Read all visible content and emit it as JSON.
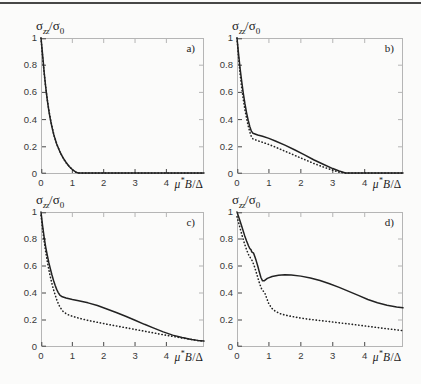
{
  "page": {
    "bg": "#fbfbfa",
    "rule_color": "#474747",
    "frame_color": "#b5b5b5",
    "tick_color": "#474747",
    "curve_color": "#222222"
  },
  "axis_labels": {
    "y_sigma": "σ",
    "y_sub": "zz",
    "y_slash": "/",
    "y_sigma0": "σ",
    "y_sub0": "0",
    "x_mu": "μ",
    "x_star": "*",
    "x_B": "B",
    "x_slash": "/",
    "x_delta": "Δ"
  },
  "chart_data": [
    {
      "type": "line",
      "label": "a)",
      "xlim": [
        0,
        5.2
      ],
      "ylim": [
        0,
        1
      ],
      "xticks": [
        0,
        1,
        2,
        3,
        4
      ],
      "xtick_labels": [
        "0",
        "1",
        "2",
        "3",
        "4"
      ],
      "yticks": [
        0,
        0.2,
        0.4,
        0.6,
        0.8,
        1
      ],
      "ytick_labels": [
        "0",
        "0.2",
        "0.4",
        "0.6",
        "0.8",
        "1"
      ],
      "series": [
        {
          "name": "solid",
          "style": "solid",
          "points": [
            [
              0,
              1
            ],
            [
              0.03,
              0.93
            ],
            [
              0.07,
              0.83
            ],
            [
              0.1,
              0.75
            ],
            [
              0.15,
              0.64
            ],
            [
              0.2,
              0.545
            ],
            [
              0.25,
              0.465
            ],
            [
              0.3,
              0.4
            ],
            [
              0.35,
              0.345
            ],
            [
              0.4,
              0.295
            ],
            [
              0.5,
              0.22
            ],
            [
              0.6,
              0.165
            ],
            [
              0.7,
              0.12
            ],
            [
              0.8,
              0.085
            ],
            [
              0.9,
              0.055
            ],
            [
              1,
              0.033
            ],
            [
              1.1,
              0.015
            ],
            [
              1.2,
              0.005
            ],
            [
              1.35,
              0.001
            ],
            [
              1.6,
              0
            ],
            [
              5.2,
              0
            ]
          ]
        },
        {
          "name": "dotted",
          "style": "dotted",
          "points": [
            [
              0,
              1
            ],
            [
              0.04,
              0.89
            ],
            [
              0.08,
              0.79
            ],
            [
              0.12,
              0.7
            ],
            [
              0.17,
              0.6
            ],
            [
              0.22,
              0.515
            ],
            [
              0.28,
              0.43
            ],
            [
              0.34,
              0.36
            ],
            [
              0.42,
              0.28
            ],
            [
              0.52,
              0.21
            ],
            [
              0.62,
              0.155
            ],
            [
              0.72,
              0.11
            ],
            [
              0.82,
              0.078
            ],
            [
              0.92,
              0.05
            ],
            [
              1.02,
              0.028
            ],
            [
              1.12,
              0.012
            ],
            [
              1.25,
              0.003
            ],
            [
              1.5,
              0
            ],
            [
              5.2,
              0
            ]
          ]
        }
      ]
    },
    {
      "type": "line",
      "label": "b)",
      "xlim": [
        0,
        5.2
      ],
      "ylim": [
        0,
        1
      ],
      "xticks": [
        0,
        1,
        2,
        3,
        4
      ],
      "xtick_labels": [
        "0",
        "1",
        "2",
        "3",
        "4"
      ],
      "yticks": [
        0,
        0.2,
        0.4,
        0.6,
        0.8,
        1
      ],
      "ytick_labels": [
        "0",
        "0.2",
        "0.4",
        "0.6",
        "0.8",
        "1"
      ],
      "series": [
        {
          "name": "solid",
          "style": "solid",
          "points": [
            [
              0,
              1
            ],
            [
              0.05,
              0.88
            ],
            [
              0.1,
              0.77
            ],
            [
              0.15,
              0.675
            ],
            [
              0.2,
              0.59
            ],
            [
              0.25,
              0.515
            ],
            [
              0.3,
              0.45
            ],
            [
              0.35,
              0.395
            ],
            [
              0.4,
              0.35
            ],
            [
              0.45,
              0.315
            ],
            [
              0.5,
              0.3
            ],
            [
              0.65,
              0.287
            ],
            [
              0.8,
              0.277
            ],
            [
              1,
              0.262
            ],
            [
              1.2,
              0.243
            ],
            [
              1.5,
              0.212
            ],
            [
              1.8,
              0.178
            ],
            [
              2.1,
              0.142
            ],
            [
              2.4,
              0.105
            ],
            [
              2.7,
              0.072
            ],
            [
              3,
              0.04
            ],
            [
              3.2,
              0.022
            ],
            [
              3.4,
              0.008
            ],
            [
              3.6,
              0.001
            ],
            [
              3.8,
              0
            ],
            [
              5.2,
              0
            ]
          ]
        },
        {
          "name": "dotted",
          "style": "dotted",
          "points": [
            [
              0,
              1
            ],
            [
              0.05,
              0.855
            ],
            [
              0.1,
              0.73
            ],
            [
              0.15,
              0.63
            ],
            [
              0.2,
              0.545
            ],
            [
              0.25,
              0.47
            ],
            [
              0.3,
              0.41
            ],
            [
              0.35,
              0.355
            ],
            [
              0.4,
              0.31
            ],
            [
              0.45,
              0.275
            ],
            [
              0.5,
              0.258
            ],
            [
              0.65,
              0.245
            ],
            [
              0.8,
              0.233
            ],
            [
              1,
              0.217
            ],
            [
              1.2,
              0.198
            ],
            [
              1.5,
              0.168
            ],
            [
              1.8,
              0.138
            ],
            [
              2.1,
              0.108
            ],
            [
              2.4,
              0.078
            ],
            [
              2.7,
              0.052
            ],
            [
              3,
              0.028
            ],
            [
              3.2,
              0.013
            ],
            [
              3.4,
              0.003
            ],
            [
              3.6,
              0
            ],
            [
              5.2,
              0
            ]
          ]
        }
      ]
    },
    {
      "type": "line",
      "label": "c)",
      "xlim": [
        0,
        5.2
      ],
      "ylim": [
        0,
        1
      ],
      "xticks": [
        0,
        1,
        2,
        3,
        4
      ],
      "xtick_labels": [
        "0",
        "1",
        "2",
        "3",
        "4"
      ],
      "yticks": [
        0,
        0.2,
        0.4,
        0.6,
        0.8,
        1
      ],
      "ytick_labels": [
        "0",
        "0.2",
        "0.4",
        "0.6",
        "0.8",
        "1"
      ],
      "series": [
        {
          "name": "solid",
          "style": "solid",
          "points": [
            [
              0,
              1
            ],
            [
              0.05,
              0.9
            ],
            [
              0.1,
              0.815
            ],
            [
              0.15,
              0.74
            ],
            [
              0.2,
              0.68
            ],
            [
              0.25,
              0.625
            ],
            [
              0.3,
              0.578
            ],
            [
              0.35,
              0.533
            ],
            [
              0.4,
              0.493
            ],
            [
              0.45,
              0.457
            ],
            [
              0.5,
              0.427
            ],
            [
              0.55,
              0.403
            ],
            [
              0.6,
              0.385
            ],
            [
              0.68,
              0.372
            ],
            [
              0.8,
              0.363
            ],
            [
              1,
              0.352
            ],
            [
              1.2,
              0.343
            ],
            [
              1.5,
              0.327
            ],
            [
              1.8,
              0.307
            ],
            [
              2.1,
              0.282
            ],
            [
              2.4,
              0.256
            ],
            [
              2.7,
              0.228
            ],
            [
              3,
              0.198
            ],
            [
              3.3,
              0.168
            ],
            [
              3.6,
              0.14
            ],
            [
              3.9,
              0.112
            ],
            [
              4.2,
              0.088
            ],
            [
              4.5,
              0.07
            ],
            [
              4.8,
              0.056
            ],
            [
              5,
              0.049
            ],
            [
              5.2,
              0.044
            ]
          ]
        },
        {
          "name": "dotted",
          "style": "dotted",
          "points": [
            [
              0,
              0.975
            ],
            [
              0.05,
              0.875
            ],
            [
              0.1,
              0.785
            ],
            [
              0.15,
              0.705
            ],
            [
              0.2,
              0.635
            ],
            [
              0.25,
              0.572
            ],
            [
              0.3,
              0.517
            ],
            [
              0.35,
              0.468
            ],
            [
              0.4,
              0.425
            ],
            [
              0.45,
              0.387
            ],
            [
              0.5,
              0.352
            ],
            [
              0.55,
              0.322
            ],
            [
              0.6,
              0.297
            ],
            [
              0.7,
              0.265
            ],
            [
              0.8,
              0.247
            ],
            [
              0.9,
              0.236
            ],
            [
              1,
              0.228
            ],
            [
              1.2,
              0.214
            ],
            [
              1.5,
              0.197
            ],
            [
              1.8,
              0.183
            ],
            [
              2.1,
              0.169
            ],
            [
              2.4,
              0.156
            ],
            [
              2.7,
              0.143
            ],
            [
              3,
              0.13
            ],
            [
              3.3,
              0.117
            ],
            [
              3.6,
              0.104
            ],
            [
              3.9,
              0.091
            ],
            [
              4.2,
              0.079
            ],
            [
              4.5,
              0.067
            ],
            [
              4.8,
              0.056
            ],
            [
              5,
              0.048
            ],
            [
              5.2,
              0.042
            ]
          ]
        }
      ]
    },
    {
      "type": "line",
      "label": "d)",
      "xlim": [
        0,
        5.2
      ],
      "ylim": [
        0,
        1
      ],
      "xticks": [
        0,
        1,
        2,
        3,
        4
      ],
      "xtick_labels": [
        "0",
        "1",
        "2",
        "3",
        "4"
      ],
      "yticks": [
        0,
        0.2,
        0.4,
        0.6,
        0.8,
        1
      ],
      "ytick_labels": [
        "0",
        "0.2",
        "0.4",
        "0.6",
        "0.8",
        "1"
      ],
      "series": [
        {
          "name": "solid",
          "style": "solid",
          "points": [
            [
              0,
              1
            ],
            [
              0.08,
              0.945
            ],
            [
              0.16,
              0.885
            ],
            [
              0.24,
              0.825
            ],
            [
              0.3,
              0.785
            ],
            [
              0.36,
              0.75
            ],
            [
              0.4,
              0.73
            ],
            [
              0.44,
              0.72
            ],
            [
              0.46,
              0.705
            ],
            [
              0.52,
              0.695
            ],
            [
              0.56,
              0.668
            ],
            [
              0.6,
              0.64
            ],
            [
              0.65,
              0.6
            ],
            [
              0.7,
              0.555
            ],
            [
              0.75,
              0.515
            ],
            [
              0.8,
              0.49
            ],
            [
              0.85,
              0.49
            ],
            [
              0.95,
              0.508
            ],
            [
              1.1,
              0.522
            ],
            [
              1.3,
              0.532
            ],
            [
              1.5,
              0.536
            ],
            [
              1.7,
              0.534
            ],
            [
              2,
              0.525
            ],
            [
              2.3,
              0.511
            ],
            [
              2.6,
              0.492
            ],
            [
              2.9,
              0.468
            ],
            [
              3.2,
              0.442
            ],
            [
              3.5,
              0.412
            ],
            [
              3.8,
              0.382
            ],
            [
              4.1,
              0.352
            ],
            [
              4.4,
              0.328
            ],
            [
              4.7,
              0.31
            ],
            [
              5,
              0.297
            ],
            [
              5.2,
              0.29
            ]
          ]
        },
        {
          "name": "dotted",
          "style": "dotted",
          "points": [
            [
              0,
              0.965
            ],
            [
              0.08,
              0.895
            ],
            [
              0.16,
              0.825
            ],
            [
              0.24,
              0.762
            ],
            [
              0.3,
              0.72
            ],
            [
              0.36,
              0.685
            ],
            [
              0.42,
              0.66
            ],
            [
              0.48,
              0.638
            ],
            [
              0.54,
              0.6
            ],
            [
              0.6,
              0.555
            ],
            [
              0.66,
              0.508
            ],
            [
              0.72,
              0.462
            ],
            [
              0.78,
              0.425
            ],
            [
              0.84,
              0.41
            ],
            [
              0.88,
              0.395
            ],
            [
              0.94,
              0.355
            ],
            [
              1,
              0.318
            ],
            [
              1.1,
              0.285
            ],
            [
              1.2,
              0.265
            ],
            [
              1.35,
              0.247
            ],
            [
              1.5,
              0.237
            ],
            [
              1.7,
              0.227
            ],
            [
              2,
              0.214
            ],
            [
              2.3,
              0.204
            ],
            [
              2.6,
              0.196
            ],
            [
              2.9,
              0.188
            ],
            [
              3.2,
              0.179
            ],
            [
              3.5,
              0.171
            ],
            [
              3.8,
              0.162
            ],
            [
              4.1,
              0.153
            ],
            [
              4.4,
              0.144
            ],
            [
              4.7,
              0.135
            ],
            [
              5,
              0.127
            ],
            [
              5.2,
              0.121
            ]
          ]
        }
      ]
    }
  ]
}
